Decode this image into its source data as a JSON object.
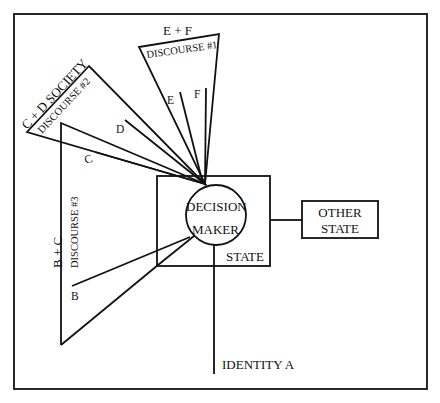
{
  "diagram": {
    "type": "conceptual-diagram",
    "labels": {
      "discourse1_group": "E + F",
      "discourse1": "DISCOURSE #1",
      "discourse2_group": "C + D  SOCIETY",
      "discourse2": "DISCOURSE #2",
      "discourse3_group": "B + C",
      "discourse3": "DISCOURSE #3",
      "actor_b": "B",
      "actor_c": "C",
      "actor_d": "D",
      "actor_e": "E",
      "actor_f": "F",
      "decision_maker_line1": "DECISION",
      "decision_maker_line2": "MAKER",
      "state": "STATE",
      "other_state_line1": "OTHER",
      "other_state_line2": "STATE",
      "identity": "IDENTITY A"
    },
    "nodes": [
      {
        "id": "decision-maker",
        "shape": "circle"
      },
      {
        "id": "state",
        "shape": "rectangle",
        "contains": "decision-maker"
      },
      {
        "id": "other-state",
        "shape": "rectangle"
      },
      {
        "id": "identity-a",
        "shape": "line-end"
      },
      {
        "id": "discourse-1",
        "shape": "wedge",
        "members": [
          "E",
          "F"
        ]
      },
      {
        "id": "discourse-2",
        "shape": "wedge",
        "members": [
          "C",
          "D"
        ],
        "group": "SOCIETY"
      },
      {
        "id": "discourse-3",
        "shape": "wedge",
        "members": [
          "B",
          "C"
        ]
      }
    ],
    "edges": [
      {
        "from": "state",
        "to": "other-state"
      },
      {
        "from": "decision-maker",
        "to": "identity-a"
      },
      {
        "from": "B",
        "to": "decision-maker"
      },
      {
        "from": "C",
        "to": "decision-maker"
      },
      {
        "from": "D",
        "to": "decision-maker"
      },
      {
        "from": "E",
        "to": "decision-maker"
      },
      {
        "from": "F",
        "to": "decision-maker"
      }
    ]
  }
}
